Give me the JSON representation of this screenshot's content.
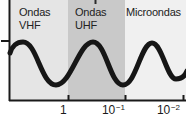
{
  "diagram": {
    "title_semantics": "Electromagnetic wave bands vs wavelength",
    "regions": [
      {
        "id": "vhf",
        "line1": "Ondas",
        "line2": "VHF",
        "band_color": "#e5e5e5"
      },
      {
        "id": "uhf",
        "line1": "Ondas",
        "line2": "UHF",
        "band_color": "#c9c9c9"
      },
      {
        "id": "microondas",
        "line1": "Microondas",
        "line2": "",
        "band_color": "#f0f0f0"
      }
    ],
    "x_axis": {
      "scale": "log-decreasing",
      "ticks": [
        {
          "base": "1",
          "exp": ""
        },
        {
          "base": "10",
          "exp": "−1"
        },
        {
          "base": "10",
          "exp": "−2"
        }
      ]
    },
    "colors": {
      "ink": "#1a1a1a",
      "background": "#ffffff",
      "band_vhf": "#e5e5e5",
      "band_uhf": "#c9c9c9",
      "band_micro": "#f0f0f0"
    }
  }
}
